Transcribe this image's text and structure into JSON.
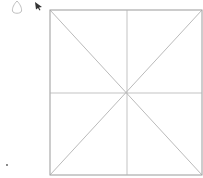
{
  "canvas": {
    "width": 203,
    "height": 178,
    "background": "#ffffff"
  },
  "diagram": {
    "square": {
      "x1": 50,
      "y1": 10,
      "x2": 202,
      "y2": 175,
      "stroke": "#9a9a9a"
    },
    "center": {
      "x": 127,
      "y": 93
    },
    "line_color": "#a8a8a8"
  },
  "icons": {
    "teardrop": "teardrop-outline",
    "cursor": "mouse-pointer-arrow",
    "dot": "small-dot"
  }
}
